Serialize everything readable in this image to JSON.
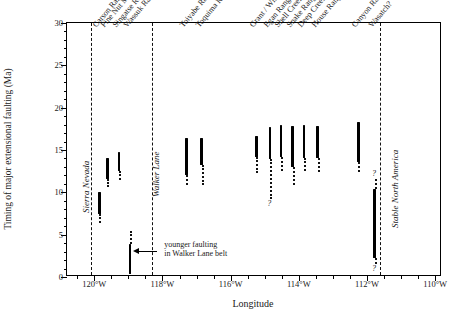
{
  "chart_data": {
    "type": "scatter",
    "title": "",
    "xlabel": "Longitude",
    "ylabel": "Timing of major extensional faulting (Ma)",
    "xlim": [
      -120.8,
      -109.8
    ],
    "ylim": [
      0,
      30
    ],
    "x_ticks": [
      -120,
      -118,
      -116,
      -114,
      -112,
      -110
    ],
    "x_tick_labels": [
      "120°W",
      "118°W",
      "116°W",
      "114°W",
      "112°W",
      "110°W"
    ],
    "x_minor_step": 0.5,
    "y_ticks": [
      0,
      5,
      10,
      15,
      20,
      25,
      30
    ],
    "y_tick_labels": [
      "0",
      "5",
      "10",
      "15",
      "20",
      "25",
      "30"
    ],
    "y_minor_step": 1,
    "grid": false,
    "legend": null,
    "ranges": [
      {
        "name": "Carson Range",
        "lon": -119.85,
        "certain_top": 10.0,
        "certain_bottom": 7.4,
        "dotted_bottom": 6.4,
        "qmark_bottom": false
      },
      {
        "name": "Pine Nut Mtns.",
        "lon": -119.62,
        "certain_top": 14.1,
        "certain_bottom": 11.6,
        "dotted_bottom": 10.6,
        "qmark_bottom": false
      },
      {
        "name": "Singatse Range",
        "lon": -119.28,
        "certain_top": 14.8,
        "certain_bottom": 12.5,
        "dotted_bottom": 11.5,
        "qmark_bottom": false
      },
      {
        "name": "Wassuk Range",
        "lon": -118.95,
        "certain_top": 3.9,
        "certain_bottom": 0.4,
        "dotted_bottom": null,
        "qmark_bottom": false,
        "dotted_top": 5.4
      },
      {
        "name": "Toiyabe Range",
        "lon": -117.3,
        "certain_top": 16.4,
        "certain_bottom": 12.1,
        "dotted_bottom": 10.9,
        "qmark_bottom": false
      },
      {
        "name": "Toquima Range",
        "lon": -116.85,
        "certain_top": 16.4,
        "certain_bottom": 13.2,
        "dotted_bottom": 10.9,
        "qmark_bottom": false
      },
      {
        "name": "Grant / White Pine R.",
        "lon": -115.25,
        "certain_top": 16.7,
        "certain_bottom": 14.2,
        "dotted_bottom": 12.3,
        "qmark_bottom": false
      },
      {
        "name": "Egan Range",
        "lon": -114.85,
        "certain_top": 17.7,
        "certain_bottom": 13.9,
        "dotted_bottom": 9.2,
        "qmark_bottom": true
      },
      {
        "name": "Shell Creek Range?",
        "lon": -114.52,
        "certain_top": 18.0,
        "certain_bottom": 14.2,
        "dotted_bottom": 12.5,
        "qmark_bottom": false
      },
      {
        "name": "Snake Range?",
        "lon": -114.18,
        "certain_top": 17.8,
        "certain_bottom": 13.0,
        "dotted_bottom": 10.9,
        "qmark_bottom": false
      },
      {
        "name": "Deep Creek Range?",
        "lon": -113.85,
        "certain_top": 18.0,
        "certain_bottom": 14.0,
        "dotted_bottom": 12.5,
        "qmark_bottom": false
      },
      {
        "name": "House Range",
        "lon": -113.45,
        "certain_top": 17.8,
        "certain_bottom": 14.0,
        "dotted_bottom": 12.4,
        "qmark_bottom": false
      },
      {
        "name": "Canyon Range",
        "lon": -112.25,
        "certain_top": 18.3,
        "certain_bottom": 13.6,
        "dotted_bottom": 12.4,
        "qmark_bottom": false
      },
      {
        "name": "Wasatch?",
        "lon": -111.78,
        "certain_top": 10.4,
        "certain_bottom": 2.3,
        "dotted_bottom": 1.5,
        "dotted_top": 11.6,
        "qmark_bottom": true,
        "qmark_top": true
      }
    ],
    "boundaries": [
      {
        "label": "Sierra Nevada",
        "lon": -120.1,
        "label_lon": -120.35,
        "label_y": 7.6
      },
      {
        "label": "Walker Lane",
        "lon": -118.32,
        "label_lon": -118.32,
        "label_y": 9.5
      },
      {
        "label": "Stable North America",
        "lon": -111.62,
        "label_lon": -111.3,
        "label_y": 5.8
      }
    ],
    "annotations": [
      {
        "text_line1": "younger faulting",
        "text_line2": "in Walker Lane belt",
        "lon": -117.95,
        "y": 3.3,
        "arrow_from_lon": -118.15,
        "arrow_to_lon": -118.85,
        "arrow_y": 3.0
      }
    ]
  },
  "figure": {
    "axis_title_x": "Longitude",
    "axis_title_y": "Timing of major extensional faulting (Ma)"
  }
}
